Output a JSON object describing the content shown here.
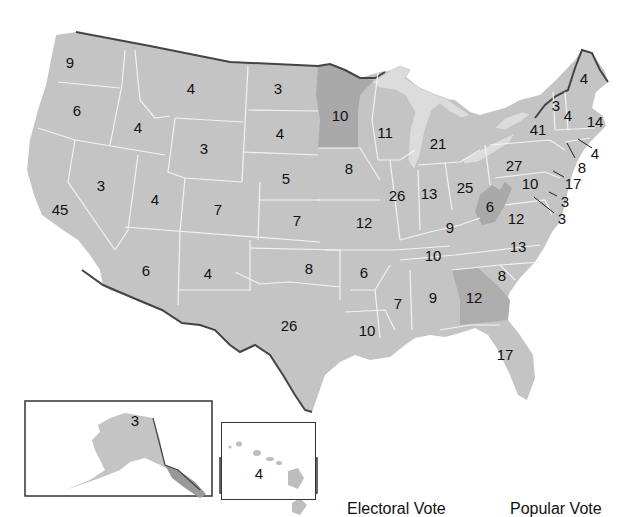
{
  "map": {
    "title": "Electoral votes by state",
    "colors": {
      "state_fill": "#c4c4c4",
      "highlight_fill": "#a9a9a9",
      "lake_fill": "#dcdcdc",
      "border_line": "#f2f2f2",
      "outline": "#444444",
      "background": "#ffffff"
    },
    "states": [
      {
        "name": "Washington",
        "votes": "9",
        "x": 70,
        "y": 62
      },
      {
        "name": "Oregon",
        "votes": "6",
        "x": 77,
        "y": 110
      },
      {
        "name": "California",
        "votes": "45",
        "x": 60,
        "y": 209
      },
      {
        "name": "Idaho",
        "votes": "4",
        "x": 138,
        "y": 127
      },
      {
        "name": "Nevada",
        "votes": "3",
        "x": 101,
        "y": 185
      },
      {
        "name": "Montana",
        "votes": "4",
        "x": 191,
        "y": 88
      },
      {
        "name": "Wyoming",
        "votes": "3",
        "x": 204,
        "y": 148
      },
      {
        "name": "Utah",
        "votes": "4",
        "x": 155,
        "y": 199
      },
      {
        "name": "Arizona",
        "votes": "6",
        "x": 146,
        "y": 270
      },
      {
        "name": "Colorado",
        "votes": "7",
        "x": 218,
        "y": 209
      },
      {
        "name": "New Mexico",
        "votes": "4",
        "x": 208,
        "y": 273
      },
      {
        "name": "North Dakota",
        "votes": "3",
        "x": 278,
        "y": 88
      },
      {
        "name": "South Dakota",
        "votes": "4",
        "x": 280,
        "y": 133
      },
      {
        "name": "Nebraska",
        "votes": "5",
        "x": 286,
        "y": 178
      },
      {
        "name": "Kansas",
        "votes": "7",
        "x": 297,
        "y": 220
      },
      {
        "name": "Oklahoma",
        "votes": "8",
        "x": 309,
        "y": 268
      },
      {
        "name": "Texas",
        "votes": "26",
        "x": 289,
        "y": 325
      },
      {
        "name": "Minnesota",
        "votes": "10",
        "x": 340,
        "y": 115
      },
      {
        "name": "Iowa",
        "votes": "8",
        "x": 349,
        "y": 168
      },
      {
        "name": "Missouri",
        "votes": "12",
        "x": 364,
        "y": 222
      },
      {
        "name": "Arkansas",
        "votes": "6",
        "x": 364,
        "y": 272
      },
      {
        "name": "Louisiana",
        "votes": "10",
        "x": 367,
        "y": 330
      },
      {
        "name": "Wisconsin",
        "votes": "11",
        "x": 385,
        "y": 132
      },
      {
        "name": "Illinois",
        "votes": "26",
        "x": 397,
        "y": 195
      },
      {
        "name": "Michigan",
        "votes": "21",
        "x": 438,
        "y": 143
      },
      {
        "name": "Indiana",
        "votes": "13",
        "x": 429,
        "y": 193
      },
      {
        "name": "Ohio",
        "votes": "25",
        "x": 465,
        "y": 187
      },
      {
        "name": "Kentucky",
        "votes": "9",
        "x": 450,
        "y": 227
      },
      {
        "name": "Tennessee",
        "votes": "10",
        "x": 433,
        "y": 255
      },
      {
        "name": "Mississippi",
        "votes": "7",
        "x": 398,
        "y": 303
      },
      {
        "name": "Alabama",
        "votes": "9",
        "x": 433,
        "y": 297
      },
      {
        "name": "Georgia",
        "votes": "12",
        "x": 474,
        "y": 297
      },
      {
        "name": "Florida",
        "votes": "17",
        "x": 505,
        "y": 354
      },
      {
        "name": "South Carolina",
        "votes": "8",
        "x": 502,
        "y": 275
      },
      {
        "name": "North Carolina",
        "votes": "13",
        "x": 518,
        "y": 246
      },
      {
        "name": "Virginia",
        "votes": "12",
        "x": 516,
        "y": 218
      },
      {
        "name": "West Virginia",
        "votes": "6",
        "x": 490,
        "y": 206
      },
      {
        "name": "Pennsylvania",
        "votes": "27",
        "x": 514,
        "y": 165
      },
      {
        "name": "New York",
        "votes": "41",
        "x": 538,
        "y": 129
      },
      {
        "name": "Vermont",
        "votes": "3",
        "x": 556,
        "y": 105
      },
      {
        "name": "New Hampshire",
        "votes": "4",
        "x": 568,
        "y": 115
      },
      {
        "name": "Maine",
        "votes": "4",
        "x": 584,
        "y": 78
      },
      {
        "name": "Massachusetts",
        "votes": "14",
        "x": 595,
        "y": 121
      },
      {
        "name": "Rhode Island",
        "votes": "4",
        "x": 595,
        "y": 153
      },
      {
        "name": "Connecticut",
        "votes": "8",
        "x": 582,
        "y": 167
      },
      {
        "name": "New Jersey",
        "votes": "17",
        "x": 573,
        "y": 183
      },
      {
        "name": "Maryland",
        "votes": "10",
        "x": 530,
        "y": 183
      },
      {
        "name": "Delaware",
        "votes": "3",
        "x": 565,
        "y": 201
      },
      {
        "name": "District of Columbia",
        "votes": "3",
        "x": 562,
        "y": 218
      },
      {
        "name": "Alaska",
        "votes": "3",
        "x": 135,
        "y": 420
      },
      {
        "name": "Hawaii",
        "votes": "4",
        "x": 259,
        "y": 473
      }
    ],
    "highlighted_states": [
      "Minnesota",
      "West Virginia",
      "Georgia"
    ]
  },
  "legend": {
    "electoral_vote_label": "Electoral Vote",
    "popular_vote_label": "Popular Vote"
  }
}
